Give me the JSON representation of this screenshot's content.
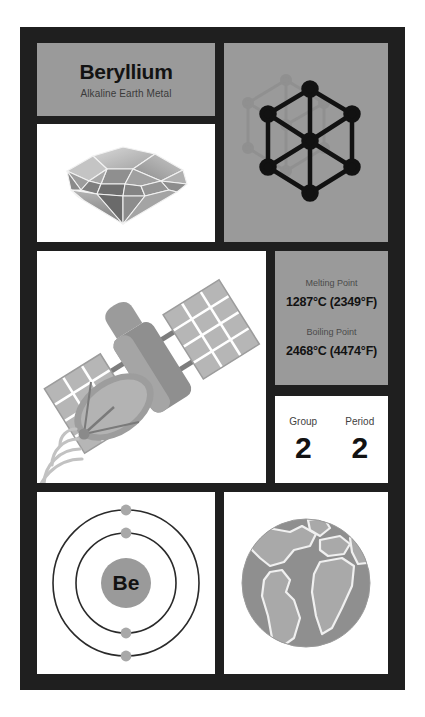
{
  "card": {
    "background_color": "#1f1f1f",
    "panel_gray": "#9a9a9a",
    "panel_white": "#ffffff"
  },
  "title_panel": {
    "element_name": "Beryllium",
    "category": "Alkaline Earth Metal"
  },
  "gem_panel": {
    "icon": "gemstone-icon",
    "description": "Faceted beryl gemstone"
  },
  "lattice_panel": {
    "icon": "hexagonal-crystal-lattice-icon",
    "description": "Hexagonal close-packed crystal structure"
  },
  "satellite_panel": {
    "icon": "satellite-icon",
    "description": "Satellite with solar panels and dish antenna emitting signal waves"
  },
  "temperature_panel": {
    "melting": {
      "label": "Melting Point",
      "value": "1287°C (2349°F)",
      "celsius": 1287,
      "fahrenheit": 2349
    },
    "boiling": {
      "label": "Boiling Point",
      "value": "2468°C (4474°F)",
      "celsius": 2468,
      "fahrenheit": 4474
    }
  },
  "group_period_panel": {
    "group": {
      "label": "Group",
      "value": "2"
    },
    "period": {
      "label": "Period",
      "value": "2"
    }
  },
  "bohr_panel": {
    "icon": "bohr-model-icon",
    "symbol": "Be",
    "shells": [
      2,
      2
    ],
    "description": "Bohr atomic model with two electron shells"
  },
  "globe_panel": {
    "icon": "earth-globe-icon",
    "description": "Earth globe showing the Americas, Africa and Europe"
  }
}
